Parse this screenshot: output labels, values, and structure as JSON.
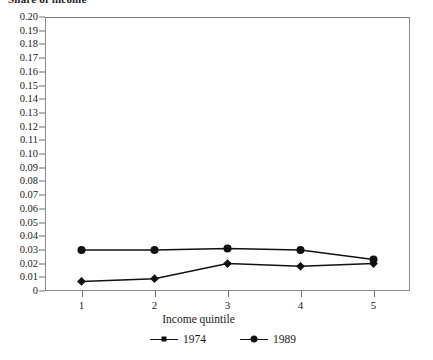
{
  "chart_data": {
    "type": "line",
    "title": "Share of income",
    "xlabel": "Income quintile",
    "ylabel": "",
    "categories": [
      "1",
      "2",
      "3",
      "4",
      "5"
    ],
    "x": [
      1,
      2,
      3,
      4,
      5
    ],
    "xlim": [
      0.5,
      5.5
    ],
    "ylim": [
      0,
      0.2
    ],
    "grid": false,
    "legend_position": "bottom",
    "y_ticks": [
      "0",
      "0.01",
      "0.02",
      "0.03",
      "0.04",
      "0.05",
      "0.06",
      "0.07",
      "0.08",
      "0.09",
      "0.10",
      "0.11",
      "0.12",
      "0.13",
      "0.14",
      "0.15",
      "0.16",
      "0.17",
      "0.18",
      "0.19",
      "0.20"
    ],
    "y_tick_values": [
      0,
      0.01,
      0.02,
      0.03,
      0.04,
      0.05,
      0.06,
      0.07,
      0.08,
      0.09,
      0.1,
      0.11,
      0.12,
      0.13,
      0.14,
      0.15,
      0.16,
      0.17,
      0.18,
      0.19,
      0.2
    ],
    "series": [
      {
        "name": "1974",
        "marker": "diamond",
        "color": "#111111",
        "values": [
          0.007,
          0.009,
          0.02,
          0.018,
          0.02
        ]
      },
      {
        "name": "1989",
        "marker": "circle",
        "color": "#111111",
        "values": [
          0.03,
          0.03,
          0.031,
          0.03,
          0.023
        ]
      }
    ]
  },
  "legend": {
    "items": [
      {
        "label": "1974",
        "marker": "diamond"
      },
      {
        "label": "1989",
        "marker": "circle"
      }
    ]
  },
  "axes": {
    "x_title": "Income quintile"
  },
  "colors": {
    "line": "#111111",
    "frame": "#8a8a8a",
    "tick": "#6e6e6e",
    "text": "#1a1a1a",
    "background": "#ffffff"
  }
}
